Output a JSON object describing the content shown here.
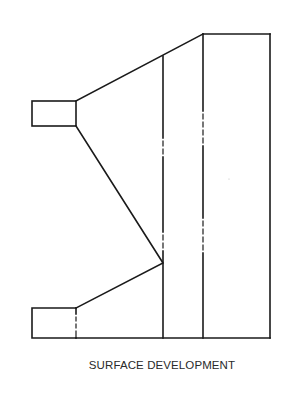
{
  "diagram": {
    "caption": "SURFACE DEVELOPMENT",
    "stroke_color": "#1a1a1a",
    "background_color": "#ffffff",
    "shapes": {
      "top_rect": {
        "x1": 32,
        "y1": 101,
        "x2": 76,
        "y2": 126
      },
      "bottom_rect": {
        "x1": 32,
        "y1": 308,
        "x2": 76,
        "y2": 338
      },
      "outer_right_edge_x": 270,
      "top_edge_y": 34,
      "bottom_edge_y": 338,
      "fold_line_1_x": 163,
      "fold_line_2_x": 203,
      "upper_slant": {
        "from": [
          76,
          101
        ],
        "to": [
          203,
          34
        ]
      },
      "middle_slant_down": {
        "from": [
          76,
          126
        ],
        "to": [
          163,
          263
        ]
      },
      "middle_slant_up": {
        "from": [
          76,
          308
        ],
        "to": [
          163,
          263
        ]
      }
    }
  }
}
